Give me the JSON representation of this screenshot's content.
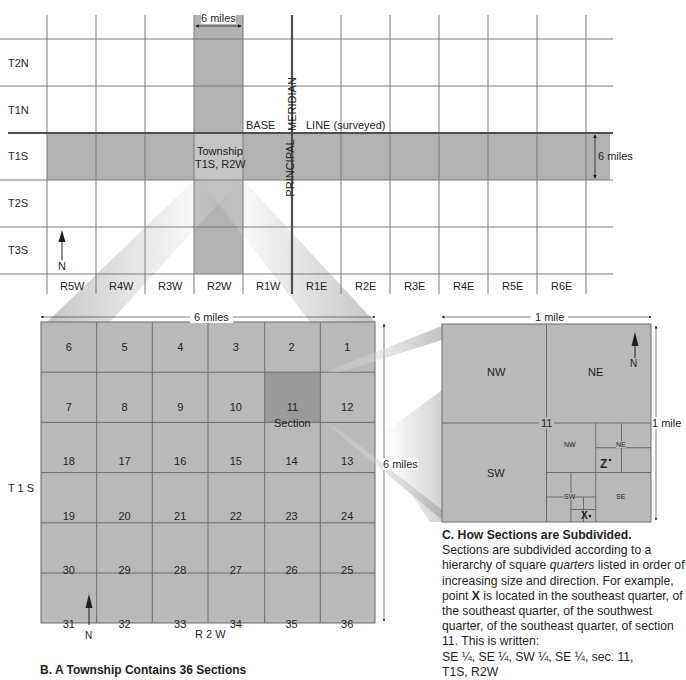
{
  "figure": {
    "top_grid": {
      "width_label": "6 miles",
      "height_label": "6 miles",
      "township_labels": [
        "T2N",
        "T1N",
        "T1S",
        "T2S",
        "T3S"
      ],
      "range_labels": [
        "R5W",
        "R4W",
        "R3W",
        "R2W",
        "R1W",
        "R1E",
        "R2E",
        "R3E",
        "R4E",
        "R5E",
        "R6E"
      ],
      "base_line_left": "BASE",
      "base_line_right": "LINE (surveyed)",
      "meridian_top": "MERIDIAN",
      "meridian_bottom": "PRINCIPAL",
      "township_highlight_line1": "Township",
      "township_highlight_line2": "T1S, R2W",
      "north_label": "N"
    },
    "township_panel": {
      "width_label": "6 miles",
      "height_label": "6 miles",
      "row_label": "T 1 S",
      "column_label": "R 2 W",
      "section_label": "Section",
      "highlight_section": "11",
      "north_label": "N",
      "sections": [
        [
          "6",
          "5",
          "4",
          "3",
          "2",
          "1"
        ],
        [
          "7",
          "8",
          "9",
          "10",
          "11",
          "12"
        ],
        [
          "18",
          "17",
          "16",
          "15",
          "14",
          "13"
        ],
        [
          "19",
          "20",
          "21",
          "22",
          "23",
          "24"
        ],
        [
          "30",
          "29",
          "28",
          "27",
          "26",
          "25"
        ],
        [
          "31",
          "32",
          "33",
          "34",
          "35",
          "36"
        ]
      ],
      "caption": "B. A Township Contains 36 Sections"
    },
    "section_panel": {
      "width_label": "1 mile",
      "height_label": "1 mile",
      "section_number": "11",
      "north_label": "N",
      "quarters": {
        "nw": "NW",
        "ne": "NE",
        "sw": "SW"
      },
      "sub_quarters": {
        "nw": "NW",
        "ne": "NE",
        "sw": "SW",
        "se": "SE"
      },
      "point_z": "Z",
      "point_x": "X",
      "caption": {
        "title": "C. How Sections are Subdivided.",
        "body_1": "Sections are subdivided according to a hierarchy of square ",
        "body_italic": "quarters",
        "body_2": " listed in order of increasing size and direction. For example, point ",
        "body_bold": "X",
        "body_3": " is located in the southeast quarter, of the southeast quarter, of the southwest quarter, of the southeast quarter, of section 11. This is written:",
        "notation_1": "SE ¼, SE ¼, SW ¼, SE ¼, sec. 11,",
        "notation_2": "T1S, R2W"
      }
    },
    "colors": {
      "gray_fill": "#b2b2b2",
      "section_fill": "#b9b9b9",
      "highlight_fill": "#9a9a9a",
      "line": "#6d6d6d",
      "thick_line": "#555555"
    }
  }
}
